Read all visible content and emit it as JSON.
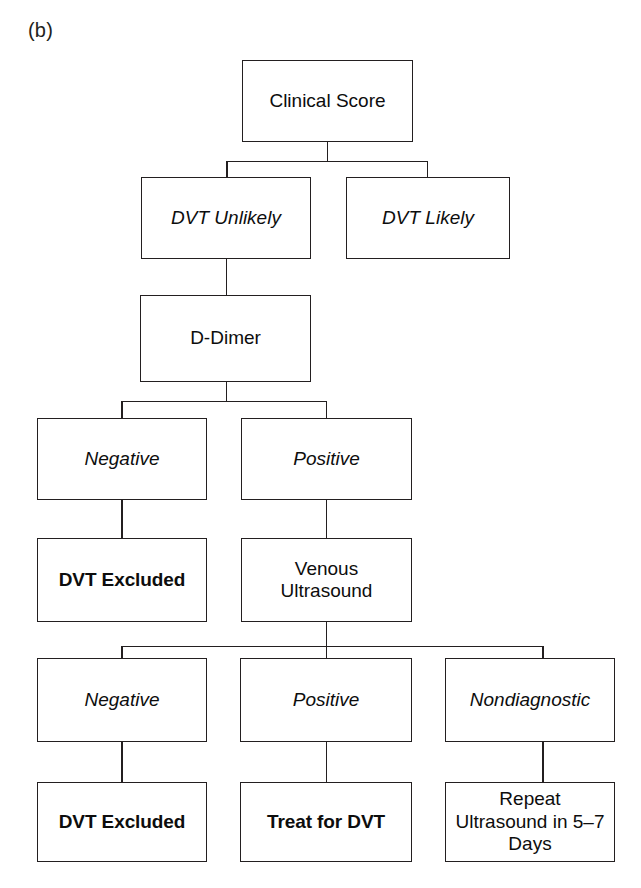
{
  "figure": {
    "panel_label": "(b)"
  },
  "nodes": {
    "clinical_score": "Clinical Score",
    "dvt_unlikely": "DVT Unlikely",
    "dvt_likely": "DVT Likely",
    "d_dimer": "D-Dimer",
    "ddimer_negative": "Negative",
    "ddimer_positive": "Positive",
    "dvt_excluded_1": "DVT Excluded",
    "venous_ultrasound": "Venous\nUltrasound",
    "us_negative": "Negative",
    "us_positive": "Positive",
    "us_nondiagnostic": "Nondiagnostic",
    "dvt_excluded_2": "DVT Excluded",
    "treat_for_dvt": "Treat for DVT",
    "repeat_ultrasound": "Repeat\nUltrasound in 5–7\nDays"
  },
  "colors": {
    "background": "#ffffff",
    "stroke": "#231f20",
    "text": "#0d0d0d"
  }
}
